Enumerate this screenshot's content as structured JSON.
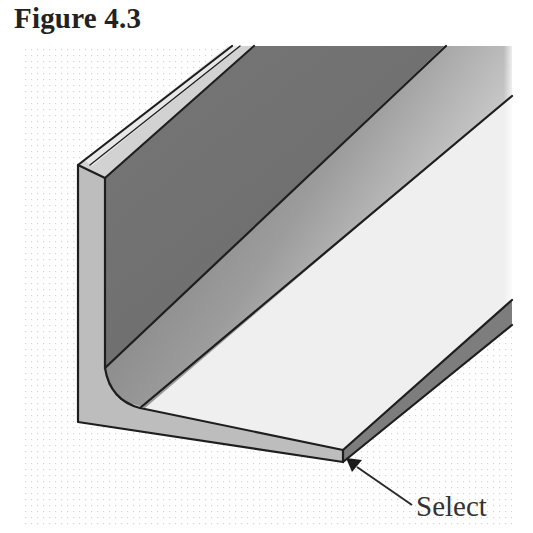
{
  "figure": {
    "title": "Figure 4.3",
    "callout": {
      "label": "Select",
      "target": "bottom-front-corner-vertex"
    }
  },
  "colors": {
    "edge": "#1e1e1e",
    "inner_vertical_face_dark": "#6e6e6e",
    "outer_side_face": "#bdbdbd",
    "horizontal_top_face": "#efefef",
    "end_face_strip": "#7d7d7d",
    "background_dots": "#cfcfcf",
    "title_text": "#222222",
    "label_text": "#333333"
  }
}
